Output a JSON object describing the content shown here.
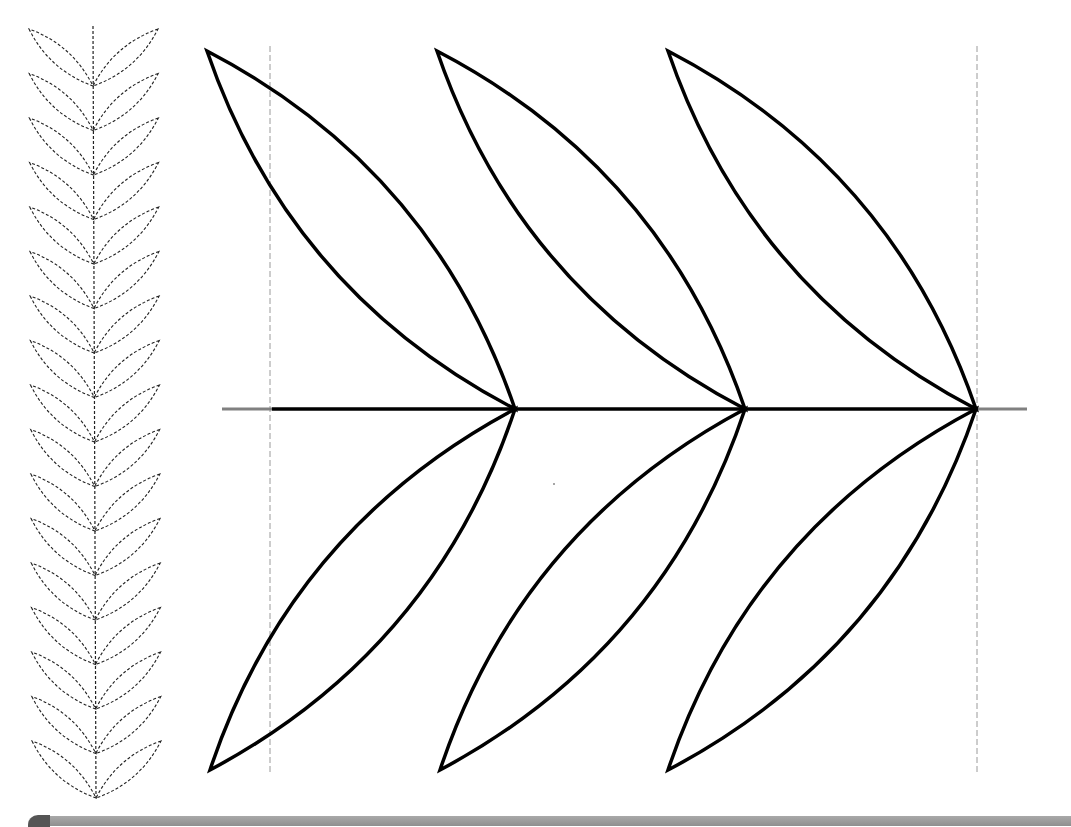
{
  "colors": {
    "background": "#ffffff",
    "outline": "#000000",
    "stem_extension": "#808080",
    "guide_line": "#9a9a9a",
    "dashed_strip": "#222222",
    "bottom_bar": "#999999",
    "bottom_bar_cap": "#555555"
  },
  "strip": {
    "pair_count": 17,
    "stem_x_top": 93,
    "stem_x_bottom": 96,
    "stem_top_y": 26,
    "first_tip_y": 29,
    "pair_spacing": 44.5,
    "tip_left_x": 29,
    "tip_right_x": 158,
    "base_offset_y": 57,
    "icon": "dashed-leaf-garland"
  },
  "sprig": {
    "stem_y": 409,
    "stem_black_start_x": 272,
    "stem_end_x": 976,
    "gray_left": [
      222,
      272
    ],
    "gray_right": [
      976,
      1027
    ],
    "guides": [
      {
        "x": 270,
        "y1": 46,
        "y2": 772
      },
      {
        "x": 977,
        "y1": 46,
        "y2": 772
      }
    ],
    "pairs": [
      {
        "base_x": 515,
        "upper_tip": [
          207,
          51
        ],
        "lower_tip": [
          210,
          770
        ]
      },
      {
        "base_x": 745,
        "upper_tip": [
          437,
          51
        ],
        "lower_tip": [
          440,
          770
        ]
      },
      {
        "base_x": 976,
        "upper_tip": [
          668,
          51
        ],
        "lower_tip": [
          668,
          770
        ]
      }
    ],
    "icon": "leaf-sprig-outline"
  },
  "bottom_bar": {
    "visible": true
  }
}
